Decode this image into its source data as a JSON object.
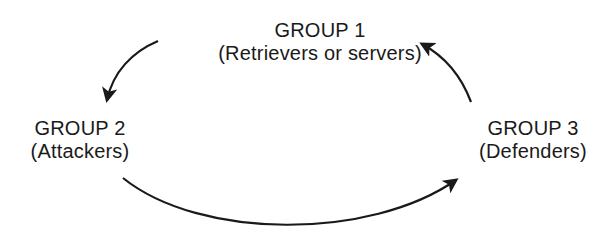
{
  "diagram": {
    "type": "cycle",
    "nodes": [
      {
        "id": "group1",
        "title": "GROUP 1",
        "subtitle": "(Retrievers or servers)"
      },
      {
        "id": "group2",
        "title": "GROUP 2",
        "subtitle": "(Attackers)"
      },
      {
        "id": "group3",
        "title": "GROUP 3",
        "subtitle": "(Defenders)"
      }
    ],
    "edges": [
      {
        "from": "group1",
        "to": "group2"
      },
      {
        "from": "group2",
        "to": "group3"
      },
      {
        "from": "group3",
        "to": "group1"
      }
    ],
    "colors": {
      "ink": "#1a1a1a",
      "background": "#ffffff"
    }
  }
}
